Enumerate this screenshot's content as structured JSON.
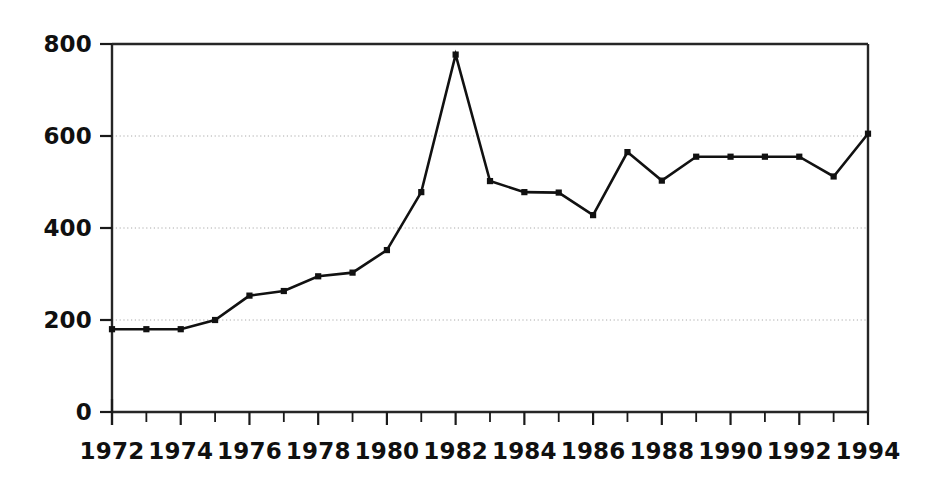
{
  "chart_data": {
    "type": "line",
    "title": "",
    "subtitle": "",
    "xlabel": "",
    "ylabel": "",
    "xlim": [
      1972,
      1994
    ],
    "ylim": [
      0,
      800
    ],
    "grid": true,
    "legend": null,
    "x": [
      1972,
      1973,
      1974,
      1975,
      1976,
      1977,
      1978,
      1979,
      1980,
      1981,
      1982,
      1983,
      1984,
      1985,
      1986,
      1987,
      1988,
      1989,
      1990,
      1991,
      1992,
      1993,
      1994
    ],
    "values": [
      180,
      180,
      180,
      200,
      253,
      263,
      295,
      303,
      352,
      478,
      777,
      502,
      478,
      477,
      428,
      565,
      503,
      555,
      555,
      555,
      555,
      512,
      605
    ],
    "series": [
      {
        "name": "series-1",
        "marker": "square",
        "color": "#111111",
        "values": [
          180,
          180,
          180,
          200,
          253,
          263,
          295,
          303,
          352,
          478,
          777,
          502,
          478,
          477,
          428,
          565,
          503,
          555,
          555,
          555,
          555,
          512,
          605
        ]
      }
    ],
    "y_ticks": [
      0,
      200,
      400,
      600,
      800
    ],
    "y_tick_labels": [
      "0",
      "200",
      "400",
      "600",
      "800"
    ],
    "x_ticks": [
      1972,
      1973,
      1974,
      1975,
      1976,
      1977,
      1978,
      1979,
      1980,
      1981,
      1982,
      1983,
      1984,
      1985,
      1986,
      1987,
      1988,
      1989,
      1990,
      1991,
      1992,
      1993,
      1994
    ],
    "x_tick_labels_major": [
      "1972",
      "1974",
      "1976",
      "1978",
      "1980",
      "1982",
      "1984",
      "1986",
      "1988",
      "1990",
      "1992",
      "1994"
    ],
    "x_major_values": [
      1972,
      1974,
      1976,
      1978,
      1980,
      1982,
      1984,
      1986,
      1988,
      1990,
      1992,
      1994
    ],
    "colors": {
      "line": "#111111",
      "marker": "#111111",
      "axis": "#1a1a1a",
      "grid": "#aaaaaa",
      "background": "#ffffff",
      "text": "#101010"
    },
    "geometry": {
      "plot_left": 112,
      "plot_right": 868,
      "plot_top": 44,
      "plot_bottom": 412
    }
  }
}
